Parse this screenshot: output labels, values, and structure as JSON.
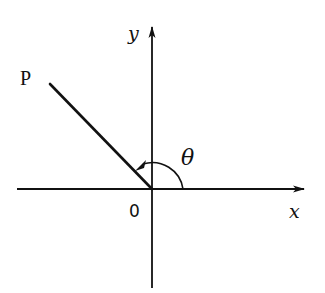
{
  "diagram": {
    "type": "angle-in-standard-position",
    "axes": {
      "x_label": "x",
      "y_label": "y",
      "origin_label": "0"
    },
    "ray": {
      "endpoint_label": "P",
      "angle_deg_approx": 134
    },
    "angle": {
      "label": "θ",
      "direction": "counterclockwise",
      "from": "positive x-axis",
      "to": "ray OP"
    },
    "colors": {
      "stroke": "#111111",
      "background": "#ffffff"
    }
  }
}
